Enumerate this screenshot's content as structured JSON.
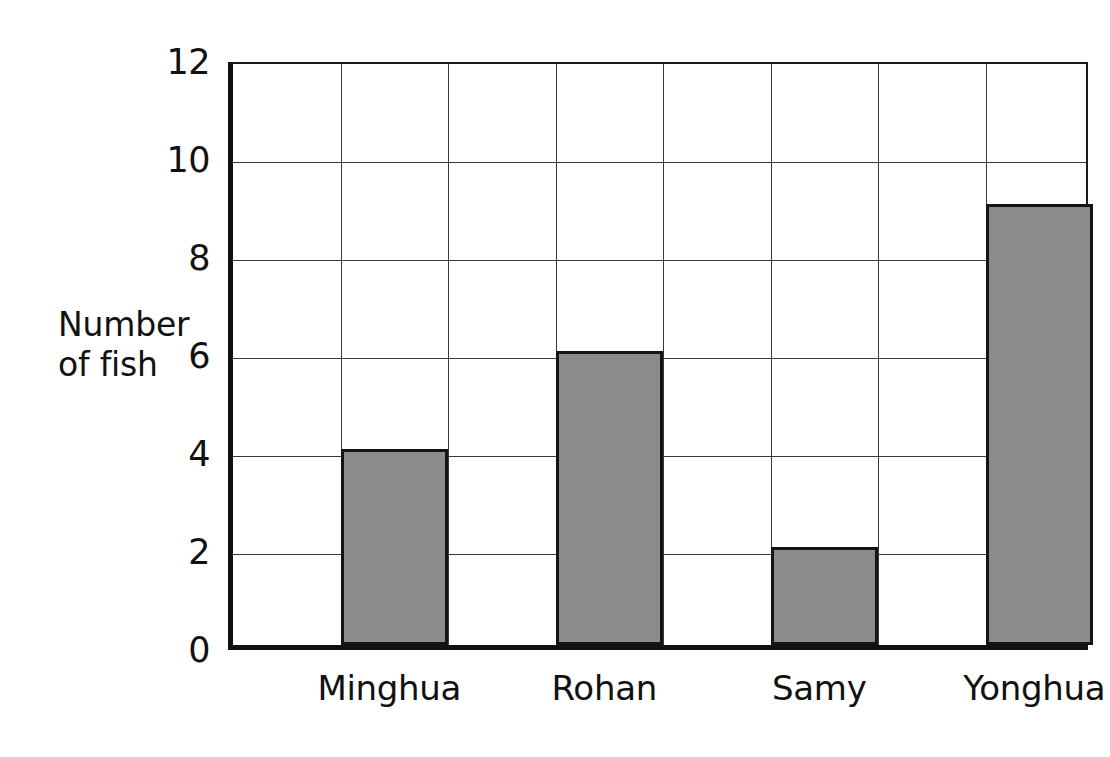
{
  "chart_data": {
    "type": "bar",
    "title": "",
    "xlabel": "",
    "ylabel": "Number of fish",
    "categories": [
      "Minghua",
      "Rohan",
      "Samy",
      "Yonghua"
    ],
    "values": [
      4,
      6,
      2,
      9
    ],
    "ylim": [
      0,
      12
    ],
    "ytick_labels": [
      "0",
      "2",
      "4",
      "6",
      "8",
      "10",
      "12"
    ],
    "ytick_values": [
      0,
      2,
      4,
      6,
      8,
      10,
      12
    ],
    "grid": true,
    "legend": null,
    "legend_position": "none",
    "bar_color": "#8b8b8b",
    "bar_edge_color": "#141414",
    "grid_color": "#3a3a3a",
    "axis_color": "#111111",
    "background_color": "#ffffff",
    "vertical_grid_columns": 8,
    "bar_column_indices": [
      1,
      3,
      5,
      7
    ]
  }
}
